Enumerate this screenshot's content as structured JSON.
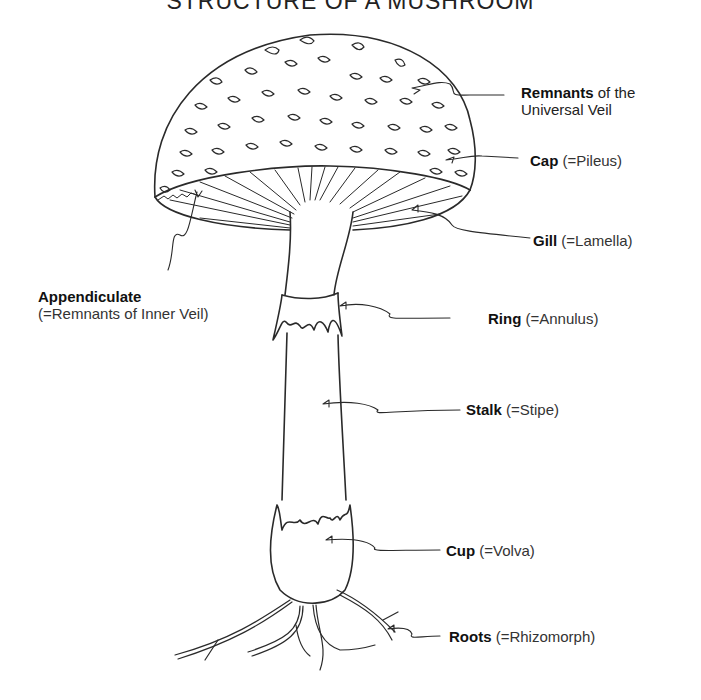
{
  "title": "STRUCTURE OF A MUSHROOM",
  "labels": {
    "remnants": {
      "term": "Remnants",
      "rest": " of the",
      "line2": "Universal Veil"
    },
    "cap": {
      "term": "Cap",
      "detail": " (=Pileus)"
    },
    "gill": {
      "term": "Gill",
      "detail": " (=Lamella)"
    },
    "appendiculate": {
      "term": "Appendiculate",
      "detail": "(=Remnants of Inner Veil)"
    },
    "ring": {
      "term": "Ring",
      "detail": " (=Annulus)"
    },
    "stalk": {
      "term": "Stalk",
      "detail": " (=Stipe)"
    },
    "cup": {
      "term": "Cup",
      "detail": " (=Volva)"
    },
    "roots": {
      "term": "Roots",
      "detail": " (=Rhizomorph)"
    }
  },
  "colors": {
    "ink": "#222222",
    "background": "#ffffff"
  }
}
